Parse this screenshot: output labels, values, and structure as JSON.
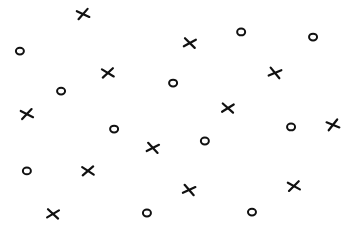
{
  "chart_data": {
    "type": "scatter",
    "title": "",
    "xlabel": "",
    "ylabel": "",
    "xlim": [
      0,
      100
    ],
    "ylim": [
      0,
      100
    ],
    "grid": false,
    "legend": "none",
    "axes_visible": false,
    "series": [
      {
        "name": "X",
        "marker": "x",
        "color": "#111111",
        "points": [
          {
            "x": 23.8,
            "y": 93.9
          },
          {
            "x": 54.4,
            "y": 81.3
          },
          {
            "x": 30.9,
            "y": 68.3
          },
          {
            "x": 78.8,
            "y": 68.3
          },
          {
            "x": 7.7,
            "y": 50.4
          },
          {
            "x": 65.3,
            "y": 53.0
          },
          {
            "x": 95.4,
            "y": 45.7
          },
          {
            "x": 43.8,
            "y": 35.7
          },
          {
            "x": 25.2,
            "y": 25.7
          },
          {
            "x": 54.2,
            "y": 17.4
          },
          {
            "x": 84.2,
            "y": 19.1
          },
          {
            "x": 15.2,
            "y": 7.0
          }
        ]
      },
      {
        "name": "O",
        "marker": "o",
        "color": "#111111",
        "points": [
          {
            "x": 5.7,
            "y": 77.8
          },
          {
            "x": 69.1,
            "y": 86.1
          },
          {
            "x": 89.7,
            "y": 83.9
          },
          {
            "x": 17.5,
            "y": 60.4
          },
          {
            "x": 49.6,
            "y": 63.9
          },
          {
            "x": 32.7,
            "y": 43.9
          },
          {
            "x": 58.7,
            "y": 38.7
          },
          {
            "x": 83.4,
            "y": 44.8
          },
          {
            "x": 7.7,
            "y": 25.7
          },
          {
            "x": 42.1,
            "y": 7.4
          },
          {
            "x": 72.2,
            "y": 7.8
          }
        ]
      }
    ]
  }
}
